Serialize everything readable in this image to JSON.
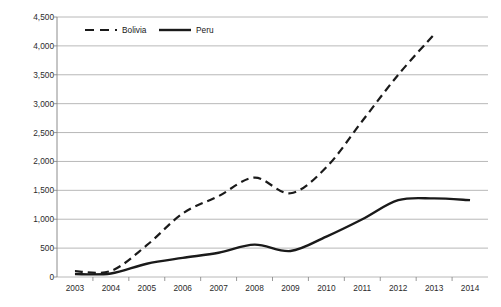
{
  "chart_data": {
    "type": "line",
    "title": "",
    "xlabel": "",
    "ylabel": "Millions of USD",
    "categories": [
      2003,
      2004,
      2005,
      2006,
      2007,
      2008,
      2009,
      2010,
      2011,
      2012,
      2013,
      2014
    ],
    "tick_labels_x": [
      "2003",
      "2004",
      "2005",
      "2006",
      "2007",
      "2008",
      "2009",
      "2010",
      "2011",
      "2012",
      "2013",
      "2014"
    ],
    "tick_labels_y": [
      "0",
      "500",
      "1,000",
      "1,500",
      "2,000",
      "2,500",
      "3,000",
      "3,500",
      "4,000",
      "4,500"
    ],
    "ylim": [
      0,
      4500
    ],
    "ytick_step": 500,
    "grid": "horizontal",
    "legend_position": "top-left-inside",
    "series": [
      {
        "name": "Bolivia",
        "style": "dashed",
        "color": "#1a1a1a",
        "values": [
          100,
          105,
          550,
          1100,
          1400,
          1720,
          1450,
          1900,
          2700,
          3500,
          4200,
          null
        ]
      },
      {
        "name": "Peru",
        "style": "solid",
        "color": "#1a1a1a",
        "values": [
          50,
          60,
          230,
          330,
          420,
          560,
          450,
          700,
          1000,
          1330,
          1360,
          1330
        ]
      }
    ]
  },
  "legend": {
    "items": [
      {
        "label": "Bolivia",
        "style": "dashed"
      },
      {
        "label": "Peru",
        "style": "solid"
      }
    ]
  },
  "colors": {
    "series_line": "#1a1a1a",
    "gridline": "#a6a6a6",
    "axis": "#808080",
    "tick_text": "#2b2b2b",
    "background": "#ffffff"
  }
}
